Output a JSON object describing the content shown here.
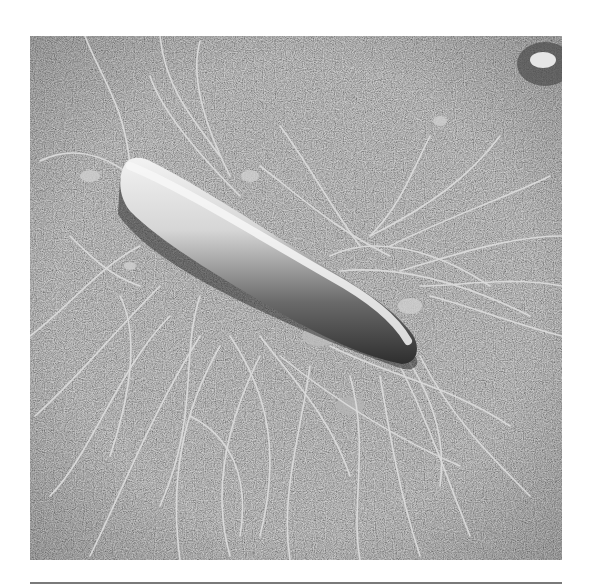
{
  "figure": {
    "style": "grayscale electron micrograph",
    "colors": {
      "background": "#8a8a8a",
      "cell_highlight": "#e8e8e8",
      "cell_shadow": "#3a3a3a",
      "flagella": "#d8d8d8",
      "rule": "#7a7a7a"
    }
  }
}
